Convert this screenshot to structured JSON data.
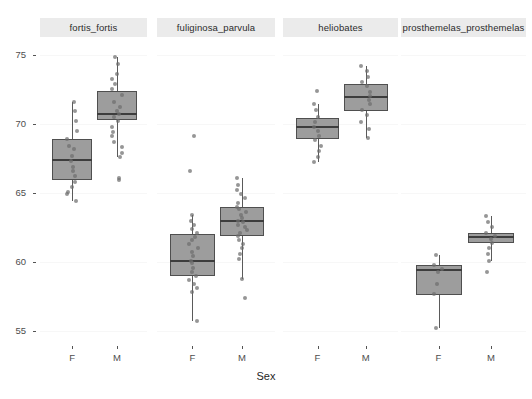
{
  "chart_data": {
    "type": "boxplot",
    "title": "",
    "xlabel": "Sex",
    "ylabel": "",
    "ylim": [
      54.0,
      76.2
    ],
    "yticks": [
      55,
      60,
      65,
      70,
      75
    ],
    "ytick_labels": [
      "55",
      "60",
      "65",
      "70",
      "75"
    ],
    "xticks": [
      "F",
      "M"
    ],
    "grid": true,
    "legend": "none",
    "facet_variable": "species",
    "facets": [
      {
        "label": "fortis_fortis",
        "groups": [
          {
            "x": "F",
            "box": {
              "q1": 65.9,
              "median": 67.4,
              "q3": 68.9,
              "whisker_low": 64.4,
              "whisker_high": 71.6
            },
            "points": [
              71.6,
              70.9,
              70.2,
              69.5,
              68.9,
              68.4,
              68.2,
              67.7,
              67.3,
              66.9,
              66.6,
              66.2,
              65.8,
              65.4,
              65.1,
              64.9,
              64.4
            ]
          },
          {
            "x": "M",
            "box": {
              "q1": 70.3,
              "median": 70.7,
              "q3": 72.4,
              "whisker_low": 67.6,
              "whisker_high": 74.8
            },
            "points": [
              74.8,
              74.3,
              73.6,
              73.2,
              72.9,
              72.5,
              72.1,
              71.6,
              71.2,
              70.9,
              70.7,
              70.5,
              70.2,
              69.8,
              69.4,
              69.1,
              68.7,
              68.3,
              67.9,
              67.6,
              66.1,
              65.9
            ]
          }
        ]
      },
      {
        "label": "fuliginosa_parvula",
        "groups": [
          {
            "x": "F",
            "box": {
              "q1": 59.0,
              "median": 60.1,
              "q3": 62.0,
              "whisker_low": 55.7,
              "whisker_high": 63.4
            },
            "points": [
              69.1,
              66.6,
              63.4,
              63.0,
              62.7,
              62.4,
              62.1,
              61.8,
              61.6,
              61.3,
              61.0,
              60.7,
              60.4,
              60.1,
              59.9,
              59.6,
              59.3,
              59.0,
              58.7,
              58.4,
              58.1,
              57.8,
              55.7
            ]
          },
          {
            "x": "M",
            "box": {
              "q1": 61.9,
              "median": 63.0,
              "q3": 64.0,
              "whisker_low": 58.8,
              "whisker_high": 66.1
            },
            "points": [
              66.1,
              65.6,
              65.2,
              64.9,
              64.6,
              64.3,
              64.0,
              63.8,
              63.6,
              63.4,
              63.2,
              63.0,
              62.9,
              62.7,
              62.5,
              62.3,
              62.1,
              61.9,
              61.6,
              61.3,
              61.0,
              60.6,
              60.2,
              58.8,
              57.4
            ]
          }
        ]
      },
      {
        "label": "heliobates",
        "groups": [
          {
            "x": "F",
            "box": {
              "q1": 68.9,
              "median": 69.8,
              "q3": 70.4,
              "whisker_low": 67.2,
              "whisker_high": 71.4
            },
            "points": [
              72.4,
              71.4,
              71.0,
              70.5,
              70.1,
              69.8,
              69.5,
              69.1,
              68.8,
              68.4,
              68.0,
              67.6,
              67.2
            ]
          },
          {
            "x": "M",
            "box": {
              "q1": 70.9,
              "median": 71.9,
              "q3": 72.9,
              "whisker_low": 69.0,
              "whisker_high": 74.2
            },
            "points": [
              74.2,
              73.8,
              73.4,
              73.0,
              72.7,
              72.3,
              72.0,
              71.7,
              71.4,
              71.0,
              70.6,
              70.1,
              69.6,
              69.0
            ]
          }
        ]
      },
      {
        "label": "prosthemelas_prosthemelas",
        "groups": [
          {
            "x": "F",
            "box": {
              "q1": 57.6,
              "median": 59.4,
              "q3": 59.8,
              "whisker_low": 55.2,
              "whisker_high": 60.5
            },
            "points": [
              60.5,
              59.8,
              59.5,
              59.3,
              58.4,
              57.7,
              55.2
            ]
          },
          {
            "x": "M",
            "box": {
              "q1": 61.4,
              "median": 61.8,
              "q3": 62.1,
              "whisker_low": 60.1,
              "whisker_high": 63.3
            },
            "points": [
              63.3,
              62.9,
              62.5,
              62.1,
              61.9,
              61.7,
              61.4,
              61.0,
              60.6,
              60.1,
              59.3
            ]
          }
        ]
      }
    ]
  },
  "axis": {
    "x_title": "Sex"
  },
  "colors": {
    "box_fill": "#9d9d9d",
    "box_border": "#4f4f4f",
    "median": "#3d3d3d",
    "point": "#6e6e6e",
    "strip_bg": "#ebebeb",
    "panel_bg": "#ffffff",
    "grid": "#f7f7f7",
    "text": "#4d4d4d"
  }
}
